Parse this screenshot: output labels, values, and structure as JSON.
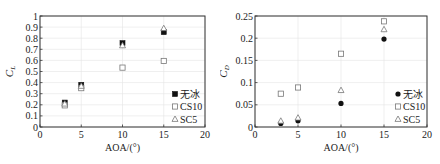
{
  "chart_data": [
    {
      "type": "scatter",
      "title": "",
      "xlabel": "AOA/(°)",
      "ylabel": "C_L",
      "xlim": [
        0,
        20
      ],
      "ylim": [
        0,
        1
      ],
      "xticks": [
        "0",
        "5",
        "10",
        "15",
        "20"
      ],
      "yticks": [
        "0",
        "0.1",
        "0.2",
        "0.3",
        "0.4",
        "0.5",
        "0.6",
        "0.7",
        "0.8",
        "0.9",
        "1"
      ],
      "grid": true,
      "legend_position": "lower right",
      "series": [
        {
          "name": "无冰",
          "marker": "filled-square",
          "x": [
            3,
            5,
            10,
            15
          ],
          "values": [
            0.22,
            0.38,
            0.755,
            0.855
          ]
        },
        {
          "name": "CS10",
          "marker": "open-square",
          "x": [
            3,
            5,
            10,
            15
          ],
          "values": [
            0.195,
            0.35,
            0.535,
            0.595
          ]
        },
        {
          "name": "SC5",
          "marker": "open-triangle",
          "x": [
            3,
            5,
            10,
            15
          ],
          "values": [
            0.21,
            0.37,
            0.735,
            0.89
          ]
        }
      ]
    },
    {
      "type": "scatter",
      "title": "",
      "xlabel": "AOA/(°)",
      "ylabel": "C_D",
      "xlim": [
        0,
        20
      ],
      "ylim": [
        0,
        0.25
      ],
      "xticks": [
        "0",
        "5",
        "10",
        "15",
        "20"
      ],
      "yticks": [
        "0",
        "0.05",
        "0.1",
        "0.15",
        "0.2",
        "0.25"
      ],
      "grid": true,
      "legend_position": "lower right",
      "series": [
        {
          "name": "无冰",
          "marker": "filled-circle",
          "x": [
            3,
            5,
            10,
            15
          ],
          "values": [
            0.008,
            0.014,
            0.053,
            0.198
          ]
        },
        {
          "name": "CS10",
          "marker": "open-square",
          "x": [
            3,
            5,
            10,
            15
          ],
          "values": [
            0.075,
            0.089,
            0.165,
            0.238
          ]
        },
        {
          "name": "SC5",
          "marker": "open-triangle",
          "x": [
            3,
            5,
            10,
            15
          ],
          "values": [
            0.014,
            0.021,
            0.083,
            0.22
          ]
        }
      ]
    }
  ],
  "left": {
    "ylabel_main": "C",
    "ylabel_sub": "L",
    "xlabel": "AOA/(°)",
    "legend": [
      "无冰",
      "CS10",
      "SC5"
    ]
  },
  "right": {
    "ylabel_main": "C",
    "ylabel_sub": "D",
    "xlabel": "AOA/(°)",
    "legend": [
      "无冰",
      "CS10",
      "SC5"
    ]
  }
}
